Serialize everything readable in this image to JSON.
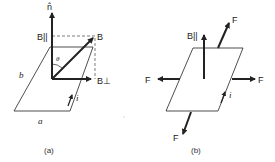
{
  "panel_a": {
    "caption": "(a)",
    "labels": {
      "normal": "n̂",
      "b_parallel": "B||",
      "b": "B",
      "b_perp": "B⊥",
      "theta": "θ",
      "side_b": "b",
      "side_a": "a",
      "current": "i"
    }
  },
  "panel_b": {
    "caption": "(b)",
    "labels": {
      "b_parallel": "B||",
      "force_top": "F",
      "force_left": "F",
      "force_right": "F",
      "force_bottom": "F",
      "current": "i"
    }
  },
  "colors": {
    "line": "#222222",
    "dashed": "#444444",
    "background": "#ffffff"
  }
}
